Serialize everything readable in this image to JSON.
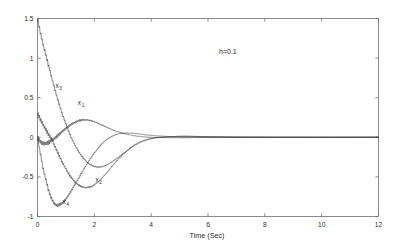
{
  "chart_data": {
    "type": "line",
    "title": "",
    "xlabel": "Time (Sec)",
    "ylabel": "",
    "xlim": [
      0,
      12
    ],
    "ylim": [
      -1,
      1.5
    ],
    "xticks": [
      0,
      2,
      4,
      6,
      8,
      10,
      12
    ],
    "yticks": [
      -1,
      -0.5,
      0,
      0.5,
      1,
      1.5
    ],
    "xtick_labels": [
      "0",
      "2",
      "4",
      "6",
      "8",
      "10",
      "12"
    ],
    "ytick_labels": [
      "-1",
      "-0.5",
      "0",
      "0.5",
      "1",
      "1.5"
    ],
    "grid": false,
    "legend": "none",
    "annotations": [
      {
        "text": "h=0.1",
        "x": 6.7,
        "y": 1.05
      }
    ],
    "inline_labels": [
      {
        "base": "x",
        "sub": "3",
        "x": 0.63,
        "y": 0.62
      },
      {
        "base": "x",
        "sub": "1",
        "x": 1.42,
        "y": 0.41
      },
      {
        "base": "x",
        "sub": "2",
        "x": 2.04,
        "y": -0.56
      },
      {
        "base": "x",
        "sub": "4",
        "x": 0.88,
        "y": -0.84
      }
    ],
    "series": [
      {
        "name": "x1",
        "chattering": true,
        "x": [
          0,
          0.05,
          0.1,
          0.15,
          0.2,
          0.25,
          0.3,
          0.35,
          0.4,
          0.5,
          0.6,
          0.7,
          0.8,
          0.9,
          1.0,
          1.1,
          1.2,
          1.3,
          1.4,
          1.5,
          1.6,
          1.7,
          1.8,
          1.9,
          2.0,
          2.2,
          2.4,
          2.6,
          2.8,
          3.0,
          3.4,
          3.8,
          4.2,
          5.0,
          6.0,
          7.0,
          8.0,
          9.0,
          10.0,
          11.0,
          12.0
        ],
        "y": [
          0,
          -0.03,
          -0.055,
          -0.07,
          -0.078,
          -0.08,
          -0.078,
          -0.072,
          -0.063,
          -0.04,
          -0.012,
          0.018,
          0.05,
          0.082,
          0.112,
          0.14,
          0.165,
          0.186,
          0.202,
          0.213,
          0.219,
          0.22,
          0.216,
          0.208,
          0.196,
          0.166,
          0.133,
          0.101,
          0.073,
          0.05,
          0.02,
          0.004,
          -0.003,
          -0.005,
          -0.003,
          -0.001,
          0,
          0,
          0,
          0,
          0
        ]
      },
      {
        "name": "x2",
        "chattering": true,
        "x": [
          0,
          0.05,
          0.1,
          0.2,
          0.3,
          0.4,
          0.5,
          0.6,
          0.7,
          0.8,
          0.9,
          1.0,
          1.1,
          1.2,
          1.3,
          1.4,
          1.5,
          1.6,
          1.7,
          1.8,
          1.9,
          2.0,
          2.1,
          2.2,
          2.4,
          2.6,
          2.8,
          3.0,
          3.4,
          3.8,
          4.2,
          5.0,
          6.0,
          7.0,
          8.0,
          9.0,
          10.0,
          11.0,
          12.0
        ],
        "y": [
          0.3,
          0.262,
          0.225,
          0.155,
          0.09,
          0.03,
          -0.026,
          -0.105,
          -0.185,
          -0.262,
          -0.333,
          -0.4,
          -0.46,
          -0.512,
          -0.556,
          -0.59,
          -0.614,
          -0.629,
          -0.634,
          -0.631,
          -0.62,
          -0.6,
          -0.572,
          -0.54,
          -0.462,
          -0.378,
          -0.293,
          -0.215,
          -0.1,
          -0.032,
          -0.002,
          0.012,
          0.008,
          0.003,
          0.001,
          0,
          0,
          0,
          0
        ]
      },
      {
        "name": "x3",
        "chattering": true,
        "x": [
          0,
          0.05,
          0.1,
          0.15,
          0.2,
          0.25,
          0.3,
          0.35,
          0.4,
          0.45,
          0.5,
          0.6,
          0.7,
          0.8,
          0.9,
          1.0,
          1.1,
          1.2,
          1.3,
          1.4,
          1.5,
          1.6,
          1.7,
          1.8,
          1.9,
          2.0,
          2.1,
          2.2,
          2.4,
          2.6,
          2.8,
          3.0,
          3.4,
          3.8,
          4.2,
          5.0,
          6.0,
          7.0,
          8.0,
          9.0,
          10.0,
          11.0,
          12.0
        ],
        "y": [
          1.5,
          1.41,
          1.325,
          1.245,
          1.17,
          1.1,
          1.03,
          0.96,
          0.89,
          0.82,
          0.752,
          0.62,
          0.495,
          0.378,
          0.268,
          0.166,
          0.072,
          -0.012,
          -0.087,
          -0.152,
          -0.21,
          -0.258,
          -0.298,
          -0.33,
          -0.353,
          -0.368,
          -0.375,
          -0.375,
          -0.355,
          -0.315,
          -0.263,
          -0.207,
          -0.105,
          -0.04,
          -0.005,
          0.012,
          0.008,
          0.003,
          0.001,
          0,
          0,
          0,
          0
        ]
      },
      {
        "name": "x4",
        "chattering": true,
        "x": [
          0,
          0.05,
          0.1,
          0.15,
          0.2,
          0.25,
          0.3,
          0.35,
          0.4,
          0.45,
          0.5,
          0.55,
          0.6,
          0.65,
          0.7,
          0.8,
          0.9,
          1.0,
          1.1,
          1.2,
          1.3,
          1.4,
          1.5,
          1.6,
          1.7,
          1.8,
          1.9,
          2.0,
          2.2,
          2.4,
          2.6,
          2.8,
          3.0,
          3.4,
          3.8,
          4.2,
          5.0,
          6.0,
          7.0,
          8.0,
          9.0,
          10.0,
          11.0,
          12.0
        ],
        "y": [
          0,
          -0.105,
          -0.205,
          -0.3,
          -0.39,
          -0.47,
          -0.545,
          -0.615,
          -0.678,
          -0.732,
          -0.778,
          -0.812,
          -0.838,
          -0.852,
          -0.858,
          -0.848,
          -0.82,
          -0.778,
          -0.726,
          -0.668,
          -0.607,
          -0.545,
          -0.482,
          -0.42,
          -0.36,
          -0.303,
          -0.248,
          -0.197,
          -0.108,
          -0.04,
          0.008,
          0.038,
          0.053,
          0.05,
          0.032,
          0.018,
          0.004,
          0.001,
          0,
          0,
          0,
          0,
          0,
          0
        ]
      }
    ]
  }
}
